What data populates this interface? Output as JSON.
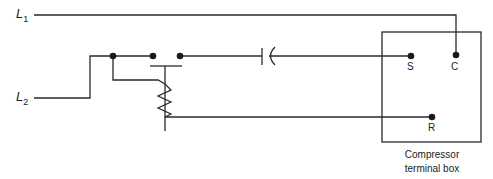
{
  "diagram": {
    "type": "wiring-schematic",
    "lines": [
      {
        "id": "L1",
        "letter": "L",
        "subscript": "1"
      },
      {
        "id": "L2",
        "letter": "L",
        "subscript": "2"
      }
    ],
    "terminals": [
      {
        "id": "S",
        "label": "S"
      },
      {
        "id": "C",
        "label": "C"
      },
      {
        "id": "R",
        "label": "R"
      }
    ],
    "components": [
      {
        "id": "start-relay",
        "kind": "potential relay with coil and contacts"
      },
      {
        "id": "start-capacitor",
        "kind": "capacitor"
      },
      {
        "id": "compressor-terminal-box",
        "kind": "enclosure"
      }
    ],
    "caption": {
      "line1": "Compressor",
      "line2": "terminal box"
    },
    "colors": {
      "wire": "#2a2a2a",
      "background": "#ffffff"
    }
  }
}
